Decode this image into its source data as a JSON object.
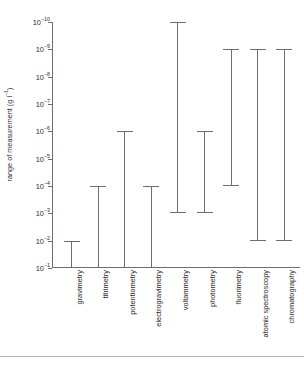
{
  "chart_data": {
    "type": "bar",
    "title": "",
    "xlabel": "",
    "ylabel": "range of measurement (g l⁻¹)",
    "ylabel_parts": {
      "prefix": "range of measurement (g l",
      "sup": "−1",
      "suffix": ")"
    },
    "yscale": "log",
    "ylim": [
      1e-10,
      0.1
    ],
    "y_axis_direction": "inverted",
    "grid": false,
    "legend": false,
    "y_ticks": [
      {
        "value": 1e-10,
        "label_mantissa": "10",
        "label_exponent": "−10"
      },
      {
        "value": 1e-09,
        "label_mantissa": "10",
        "label_exponent": "−9"
      },
      {
        "value": 1e-08,
        "label_mantissa": "10",
        "label_exponent": "−8"
      },
      {
        "value": 1e-07,
        "label_mantissa": "10",
        "label_exponent": "−7"
      },
      {
        "value": 1e-06,
        "label_mantissa": "10",
        "label_exponent": "−6"
      },
      {
        "value": 1e-05,
        "label_mantissa": "10",
        "label_exponent": "−5"
      },
      {
        "value": 0.0001,
        "label_mantissa": "10",
        "label_exponent": "−4"
      },
      {
        "value": 0.001,
        "label_mantissa": "10",
        "label_exponent": "−3"
      },
      {
        "value": 0.01,
        "label_mantissa": "10",
        "label_exponent": "−2"
      },
      {
        "value": 0.1,
        "label_mantissa": "10",
        "label_exponent": "−1"
      }
    ],
    "categories": [
      "gravimetry",
      "titrimetry",
      "potentiometry",
      "electrogravimetry",
      "voltammetry",
      "photometry",
      "fluorimetry",
      "atomic spectroscopy",
      "chromatography"
    ],
    "ranges": [
      {
        "category": "gravimetry",
        "min_exp": -2,
        "max_exp": -1,
        "top_cap": true,
        "bottom_cap": false
      },
      {
        "category": "titrimetry",
        "min_exp": -4,
        "max_exp": -1,
        "top_cap": true,
        "bottom_cap": false
      },
      {
        "category": "potentiometry",
        "min_exp": -6,
        "max_exp": -1,
        "top_cap": true,
        "bottom_cap": false
      },
      {
        "category": "electrogravimetry",
        "min_exp": -4,
        "max_exp": -1,
        "top_cap": true,
        "bottom_cap": false
      },
      {
        "category": "voltammetry",
        "min_exp": -10,
        "max_exp": -3,
        "top_cap": true,
        "bottom_cap": true
      },
      {
        "category": "photometry",
        "min_exp": -6,
        "max_exp": -3,
        "top_cap": true,
        "bottom_cap": true
      },
      {
        "category": "fluorimetry",
        "min_exp": -9,
        "max_exp": -4,
        "top_cap": true,
        "bottom_cap": true
      },
      {
        "category": "atomic spectroscopy",
        "min_exp": -9,
        "max_exp": -2,
        "top_cap": true,
        "bottom_cap": true
      },
      {
        "category": "chromatography",
        "min_exp": -9,
        "max_exp": -2,
        "top_cap": true,
        "bottom_cap": true
      }
    ],
    "colors": {
      "line": "#6e6e6e",
      "text": "#2b2b2b",
      "background": "#ffffff"
    }
  }
}
